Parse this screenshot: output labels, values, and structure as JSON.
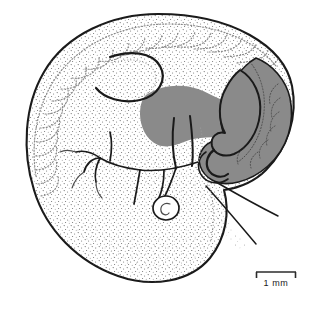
{
  "figure": {
    "domain": "scientific-illustration",
    "background_color": "#ffffff",
    "outline_color": "#1a1a1a",
    "stipple_color": "#5a5a5a",
    "dotted_color": "#8f8f8f",
    "shade_gray": "#8a8a8a",
    "shade_gray_dark": "#7d7d7d"
  },
  "scale_bar": {
    "label": "1 mm",
    "bar_color": "#2b2b2b",
    "x_left": 256,
    "x_right": 296,
    "y": 272,
    "tick_height": 6,
    "length_px": 40
  },
  "structures": [
    {
      "name": "embryo-body-outline",
      "label": "Embryo body outline",
      "shaded": false
    },
    {
      "name": "somite-row",
      "label": "Somites (dorsal dotted arcs)",
      "count": 22,
      "shaded": false
    },
    {
      "name": "neural-fold-hook",
      "label": "Head / neural fold",
      "shaded": false
    },
    {
      "name": "gray-organ-anterior",
      "label": "Shaded organ primordium (anterior lobe)",
      "shaded": true,
      "fill": "#8a8a8a"
    },
    {
      "name": "gray-organ-caudal",
      "label": "Shaded caudal / tail region",
      "shaded": true,
      "fill": "#8a8a8a"
    },
    {
      "name": "branching-vessels",
      "label": "Branching vascular network",
      "shaded": false
    },
    {
      "name": "otic-vesicle",
      "label": "Small vesicle (spiral)",
      "shaded": false
    },
    {
      "name": "trailing-filaments",
      "label": "Two trailing filaments",
      "shaded": false
    }
  ]
}
